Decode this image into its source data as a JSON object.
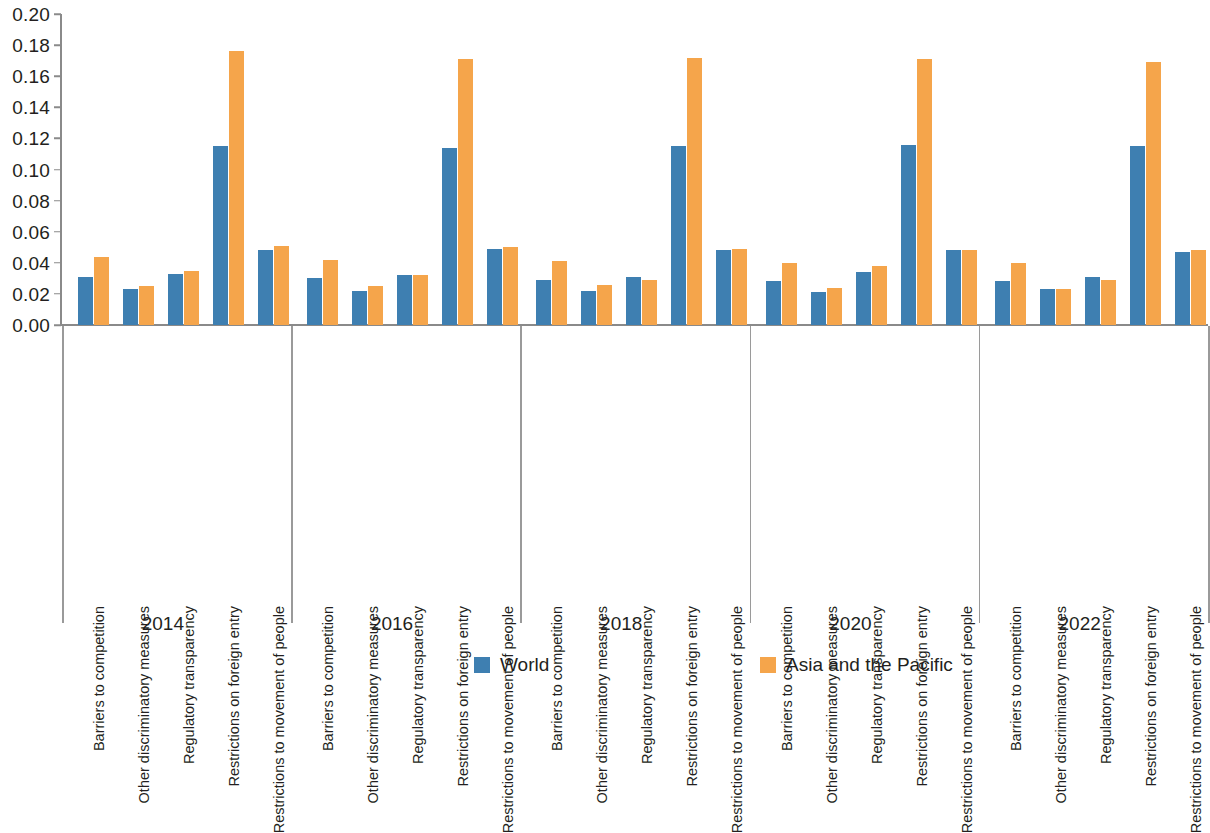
{
  "chart_data": {
    "type": "bar",
    "title": "",
    "subtitle": "",
    "xlabel": "",
    "ylabel": "",
    "ylim": [
      0.0,
      0.2
    ],
    "ytick_step": 0.02,
    "ytick_labels": [
      "0.20",
      "0.18",
      "0.16",
      "0.14",
      "0.12",
      "0.10",
      "0.08",
      "0.06",
      "0.04",
      "0.02",
      "0.00"
    ],
    "ytick_values": [
      0.2,
      0.18,
      0.16,
      0.14,
      0.12,
      0.1,
      0.08,
      0.06,
      0.04,
      0.02,
      0.0
    ],
    "grid": false,
    "legend_position": "bottom",
    "orientation": "vertical",
    "grouping": "grouped",
    "group_labels": [
      "2014",
      "2016",
      "2018",
      "2020",
      "2022"
    ],
    "categories": [
      "Barriers to competition",
      "Other discriminatory measures",
      "Regulatory transparency",
      "Restrictions on foreign entry",
      "Restrictions to movement of people"
    ],
    "series": [
      {
        "name": "World",
        "color": "#3E7FB1",
        "values_by_group": {
          "2014": [
            0.031,
            0.023,
            0.033,
            0.115,
            0.048
          ],
          "2016": [
            0.03,
            0.022,
            0.032,
            0.114,
            0.049
          ],
          "2018": [
            0.029,
            0.022,
            0.031,
            0.115,
            0.048
          ],
          "2020": [
            0.028,
            0.021,
            0.034,
            0.116,
            0.048
          ],
          "2022": [
            0.028,
            0.023,
            0.031,
            0.115,
            0.047
          ]
        }
      },
      {
        "name": "Asia and the Pacific",
        "color": "#F5A54B",
        "values_by_group": {
          "2014": [
            0.044,
            0.025,
            0.035,
            0.176,
            0.051
          ],
          "2016": [
            0.042,
            0.025,
            0.032,
            0.171,
            0.05
          ],
          "2018": [
            0.041,
            0.026,
            0.029,
            0.172,
            0.049
          ],
          "2020": [
            0.04,
            0.024,
            0.038,
            0.171,
            0.048
          ],
          "2022": [
            0.04,
            0.023,
            0.029,
            0.169,
            0.048
          ]
        }
      }
    ]
  },
  "legend": {
    "items": [
      {
        "label": "World",
        "color": "#3E7FB1"
      },
      {
        "label": "Asia and the Pacific",
        "color": "#F5A54B"
      }
    ]
  }
}
